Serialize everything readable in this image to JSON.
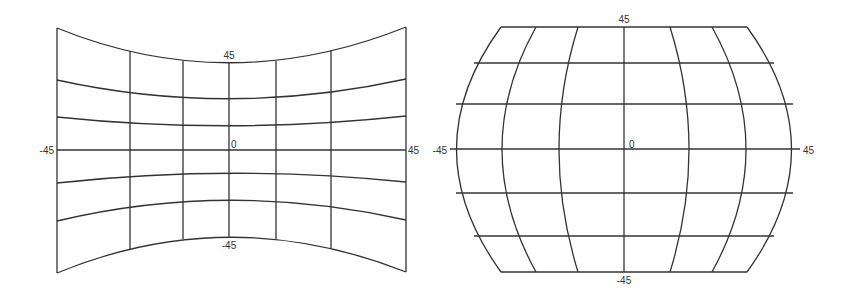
{
  "colors": {
    "line": "#333333",
    "background": "#ffffff",
    "label": "#333333"
  },
  "panels": [
    {
      "name": "concave-projection",
      "labels": [
        {
          "text": "45",
          "x": 229,
          "y": 59,
          "anchor": "middle"
        },
        {
          "text": "0",
          "x": 231,
          "y": 148,
          "anchor": "start"
        },
        {
          "text": "-45",
          "x": 54,
          "y": 154,
          "anchor": "end"
        },
        {
          "text": "45",
          "x": 408,
          "y": 154,
          "anchor": "start"
        },
        {
          "text": "-45",
          "x": 229,
          "y": 249,
          "anchor": "middle"
        }
      ],
      "parallels": [
        "M57,28 Q229,98 406,27",
        "M57,80 Q229,118 406,79",
        "M57,117 Q229,135 406,116",
        "M57,150 L406,150",
        "M57,183 Q229,164 406,182",
        "M57,221 Q229,180 406,220",
        "M57,273 Q229,202 406,272"
      ],
      "meridians": [
        "M57,28 L57,273",
        "M130,51 L130,249",
        "M183,61 L183,239",
        "M229,63 L229,237",
        "M276,61 L276,239",
        "M331,50 L331,249",
        "M406,27 L406,272"
      ]
    },
    {
      "name": "convex-projection",
      "labels": [
        {
          "text": "45",
          "x": 624,
          "y": 23,
          "anchor": "middle"
        },
        {
          "text": "0",
          "x": 629,
          "y": 148,
          "anchor": "start"
        },
        {
          "text": "-45",
          "x": 447,
          "y": 154,
          "anchor": "end"
        },
        {
          "text": "45",
          "x": 803,
          "y": 154,
          "anchor": "start"
        },
        {
          "text": "-45",
          "x": 624,
          "y": 284,
          "anchor": "middle"
        }
      ],
      "parallels": [
        "M501,27 L747,27",
        "M474,63 L774,63",
        "M456,104 L793,104",
        "M450,149 L800,149",
        "M456,193 L793,193",
        "M474,236 L774,236",
        "M501,272 L747,272"
      ],
      "meridians": [
        "M501,27 Q412,149 501,272",
        "M536,27 Q468,149 536,272",
        "M578,27 Q540,149 578,272",
        "M624,27 L624,272",
        "M670,27 Q708,149 670,272",
        "M712,27 Q780,149 712,272",
        "M747,27 Q836,149 747,272"
      ]
    }
  ]
}
